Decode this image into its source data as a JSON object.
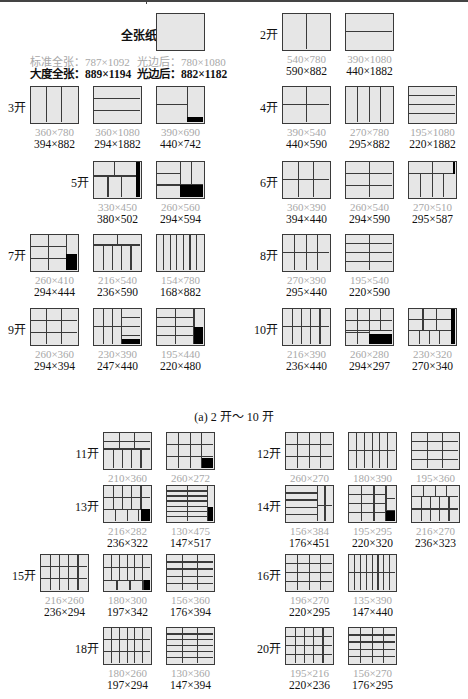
{
  "full_sheet": {
    "label": "全张纸",
    "standard_full": "标准全张：787×1092",
    "standard_trimmed": "光边后：780×1080",
    "large_full": "大度全张：889×1194",
    "large_trimmed": "光边后：882×1182"
  },
  "caption_a": "(a) 2 开～ 10 开",
  "groups": [
    {
      "label": "2开",
      "items": [
        {
          "std": "540×780",
          "big": "590×882"
        },
        {
          "std": "390×1080",
          "big": "440×1882"
        }
      ]
    },
    {
      "label": "3开",
      "items": [
        {
          "std": "360×780",
          "big": "394×882"
        },
        {
          "std": "360×1080",
          "big": "294×1882"
        },
        {
          "std": "390×690",
          "big": "440×742"
        }
      ]
    },
    {
      "label": "4开",
      "items": [
        {
          "std": "390×540",
          "big": "440×590"
        },
        {
          "std": "270×780",
          "big": "295×882"
        },
        {
          "std": "195×1080",
          "big": "220×1882"
        }
      ]
    },
    {
      "label": "5开",
      "items": [
        {
          "std": "330×450",
          "big": "380×502"
        },
        {
          "std": "260×560",
          "big": "294×594"
        }
      ]
    },
    {
      "label": "6开",
      "items": [
        {
          "std": "360×390",
          "big": "394×440"
        },
        {
          "std": "260×540",
          "big": "294×590"
        },
        {
          "std": "270×510",
          "big": "295×587"
        }
      ]
    },
    {
      "label": "7开",
      "items": [
        {
          "std": "260×410",
          "big": "294×444"
        },
        {
          "std": "216×540",
          "big": "236×590"
        },
        {
          "std": "154×780",
          "big": "168×882"
        }
      ]
    },
    {
      "label": "8开",
      "items": [
        {
          "std": "270×390",
          "big": "295×440"
        },
        {
          "std": "195×540",
          "big": "220×590"
        }
      ]
    },
    {
      "label": "9开",
      "items": [
        {
          "std": "260×360",
          "big": "294×394"
        },
        {
          "std": "230×390",
          "big": "247×440"
        },
        {
          "std": "195×440",
          "big": "220×480"
        }
      ]
    },
    {
      "label": "10开",
      "items": [
        {
          "std": "216×390",
          "big": "236×440"
        },
        {
          "std": "260×280",
          "big": "294×297"
        },
        {
          "std": "230×320",
          "big": "270×340"
        }
      ]
    },
    {
      "label": "11开",
      "items": [
        {
          "std": "210×360",
          "big": "236×394"
        },
        {
          "std": "260×272",
          "big": "294×300"
        }
      ]
    },
    {
      "label": "12开",
      "items": [
        {
          "std": "260×270",
          "big": "294×295"
        },
        {
          "std": "180×390",
          "big": "197×440"
        },
        {
          "std": "195×360",
          "big": "220×394"
        }
      ]
    },
    {
      "label": "13开",
      "items": [
        {
          "std": "216×282",
          "big": "236×322"
        },
        {
          "std": "130×475",
          "big": "147×517"
        }
      ]
    },
    {
      "label": "14开",
      "items": [
        {
          "std": "156×384",
          "big": "176×451"
        },
        {
          "std": "195×295",
          "big": "220×320"
        },
        {
          "std": "216×270",
          "big": "236×323"
        }
      ]
    },
    {
      "label": "15开",
      "items": [
        {
          "std": "216×260",
          "big": "236×294"
        },
        {
          "std": "180×300",
          "big": "197×342"
        },
        {
          "std": "156×360",
          "big": "176×394"
        }
      ]
    },
    {
      "label": "16开",
      "items": [
        {
          "std": "196×270",
          "big": "220×295"
        },
        {
          "std": "135×390",
          "big": "147×440"
        }
      ]
    },
    {
      "label": "18开",
      "items": [
        {
          "std": "180×260",
          "big": "197×294"
        },
        {
          "std": "130×360",
          "big": "147×394"
        }
      ]
    },
    {
      "label": "20开",
      "items": [
        {
          "std": "195×216",
          "big": "220×236"
        },
        {
          "std": "156×270",
          "big": "176×295"
        }
      ]
    }
  ]
}
